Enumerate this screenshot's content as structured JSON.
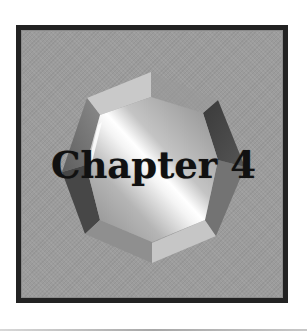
{
  "cover": {
    "title": "Chapter 4",
    "colors": {
      "frame_border": "#222222",
      "frame_fill": "#9c9c9c",
      "bevel_light": "#c9c9c9",
      "bevel_dark": "#4a4a4a",
      "bevel_mid": "#6e6e6e",
      "text": "#111111",
      "bottom_rule": "#b0b0b0"
    },
    "icon": "octagon-gem-icon"
  }
}
